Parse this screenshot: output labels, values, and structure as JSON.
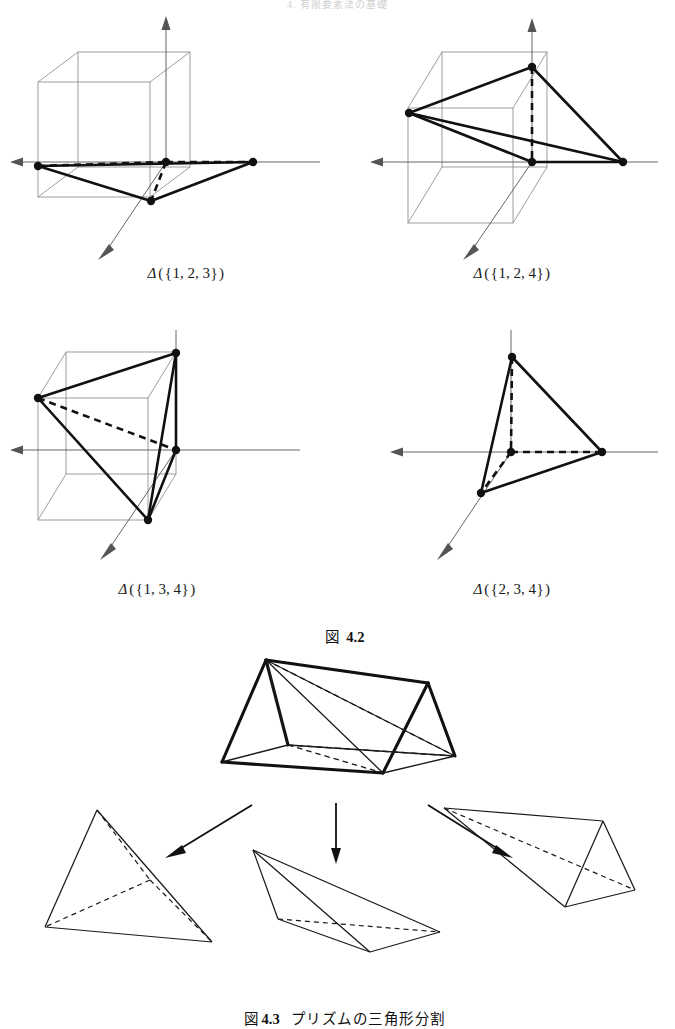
{
  "running_head": "4. 有限要素法の基礎",
  "figures": {
    "tetra_group": [
      {
        "id": "tetra-123",
        "label_delta": "Δ",
        "label_open": "(",
        "label_brace_open": "{",
        "label_set": "1, 2, 3",
        "label_brace_close": "}",
        "label_close": ")",
        "label_full": "Δ({1, 2, 3})",
        "has_cube": true,
        "vertex_count": 4
      },
      {
        "id": "tetra-124",
        "label_delta": "Δ",
        "label_open": "(",
        "label_brace_open": "{",
        "label_set": "1, 2, 4",
        "label_brace_close": "}",
        "label_close": ")",
        "label_full": "Δ({1, 2, 4})",
        "has_cube": true,
        "vertex_count": 4
      },
      {
        "id": "tetra-134",
        "label_delta": "Δ",
        "label_open": "(",
        "label_brace_open": "{",
        "label_set": "1, 3, 4",
        "label_brace_close": "}",
        "label_close": ")",
        "label_full": "Δ({1, 3, 4})",
        "has_cube": true,
        "vertex_count": 4
      },
      {
        "id": "tetra-234",
        "label_delta": "Δ",
        "label_open": "(",
        "label_brace_open": "{",
        "label_set": "2, 3, 4",
        "label_brace_close": "}",
        "label_close": ")",
        "label_full": "Δ({2, 3, 4})",
        "has_cube": false,
        "vertex_count": 4
      }
    ],
    "caption_42": {
      "marker": "図",
      "number": "4.2",
      "title": ""
    },
    "caption_43": {
      "marker": "図",
      "number": "4.3",
      "title": "プリズムの三角形分割"
    },
    "prism": {
      "name": "triangular-prism",
      "decomposition_count": 3,
      "arrow_count": 3
    }
  },
  "colors": {
    "ink": "#111111",
    "axis": "#555555",
    "cube_line": "#8b8b8b",
    "paper": "#ffffff",
    "running_head": "#cfcfcf"
  }
}
